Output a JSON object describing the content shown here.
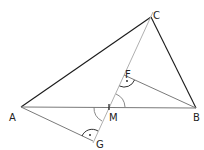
{
  "diagram": {
    "type": "geometry-triangle",
    "points": {
      "A": {
        "label": "A",
        "x": 21,
        "y": 107
      },
      "B": {
        "label": "B",
        "x": 196,
        "y": 108
      },
      "C": {
        "label": "C",
        "x": 151,
        "y": 17
      },
      "M": {
        "label": "M",
        "x": 109,
        "y": 107
      },
      "F": {
        "label": "F",
        "x": 124,
        "y": 76
      },
      "G": {
        "label": "G",
        "x": 93,
        "y": 142
      }
    },
    "colors": {
      "dark_line": "#1a1a1a",
      "mid_line": "#7a7a7a",
      "light_line": "#b0b0b0",
      "label": "#222222"
    }
  }
}
